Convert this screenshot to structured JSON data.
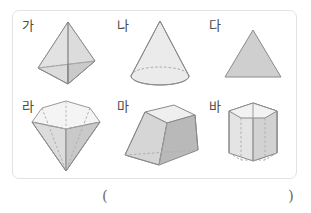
{
  "worksheet": {
    "shapes": [
      {
        "label": "가",
        "name": "triangular-pyramid",
        "type": "tetrahedron",
        "dimension": "3d"
      },
      {
        "label": "나",
        "name": "cone",
        "type": "cone",
        "dimension": "3d"
      },
      {
        "label": "다",
        "name": "triangle",
        "type": "triangle",
        "dimension": "2d"
      },
      {
        "label": "라",
        "name": "hexagonal-bipyramid",
        "type": "diamond",
        "dimension": "3d"
      },
      {
        "label": "마",
        "name": "square-frustum",
        "type": "truncated-pyramid",
        "dimension": "3d"
      },
      {
        "label": "바",
        "name": "hexagonal-prism",
        "type": "prism",
        "dimension": "3d"
      }
    ],
    "answer": {
      "open_paren": "(",
      "close_paren": ")",
      "value": ""
    },
    "colors": {
      "border": "#e3e3e3",
      "label_text": "#4a4a4a",
      "outline": "#8a8a8a",
      "fill_light": "#f2f2f2",
      "fill_mid": "#d8d8d8",
      "fill_dark": "#bdbdbd",
      "hidden_edge": "#b0b0b0",
      "paren_text": "#6f6f6f",
      "background": "#ffffff"
    }
  }
}
